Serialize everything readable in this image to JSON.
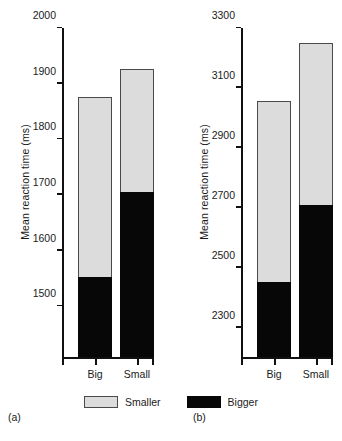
{
  "figure": {
    "background": "#ffffff",
    "colors": {
      "smaller": "#dcdcdc",
      "bigger": "#070707",
      "axis": "#111111",
      "bar_border": "#4a4a4a"
    },
    "legend": {
      "items": [
        {
          "label": "Smaller",
          "color": "#dcdcdc",
          "icon": "legend-swatch-smaller"
        },
        {
          "label": "Bigger",
          "color": "#070707",
          "icon": "legend-swatch-bigger"
        }
      ]
    },
    "panels": [
      {
        "caption": "(a)"
      },
      {
        "caption": "(b)"
      }
    ]
  },
  "chart_data": [
    {
      "type": "bar",
      "stacked": true,
      "panel": "(a)",
      "title": "",
      "xlabel": "",
      "ylabel": "Mean reaction time (ms)",
      "categories": [
        "Big",
        "Small"
      ],
      "ylim": [
        1405,
        2000
      ],
      "yticks": [
        1500,
        1600,
        1700,
        1800,
        1900,
        2000
      ],
      "ytick_labels": [
        "1500",
        "1600",
        "1700",
        "1800",
        "1900",
        "2000"
      ],
      "grid": false,
      "legend_position": "bottom-center",
      "series": [
        {
          "name": "Bigger",
          "color": "#070707",
          "values": [
            1548,
            1700
          ]
        },
        {
          "name": "Smaller",
          "color": "#dcdcdc",
          "values": [
            1873,
            1923
          ]
        }
      ],
      "bar_totals": [
        1873,
        1923
      ],
      "bar_splits": [
        1548,
        1700
      ]
    },
    {
      "type": "bar",
      "stacked": true,
      "panel": "(b)",
      "title": "",
      "xlabel": "",
      "ylabel": "Mean reaction time (ms)",
      "categories": [
        "Big",
        "Small"
      ],
      "ylim": [
        2195,
        3300
      ],
      "yticks": [
        2300,
        2500,
        2700,
        2900,
        3100,
        3300
      ],
      "ytick_labels": [
        "2300",
        "2500",
        "2700",
        "2900",
        "3100",
        "3300"
      ],
      "grid": false,
      "legend_position": "bottom-center",
      "series": [
        {
          "name": "Bigger",
          "color": "#070707",
          "values": [
            2443,
            2700
          ]
        },
        {
          "name": "Smaller",
          "color": "#dcdcdc",
          "values": [
            3050,
            3245
          ]
        }
      ],
      "bar_totals": [
        3050,
        3245
      ],
      "bar_splits": [
        2443,
        2700
      ]
    }
  ]
}
